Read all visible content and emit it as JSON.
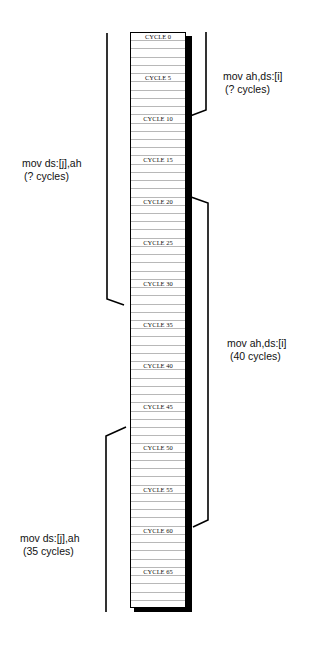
{
  "diagram": {
    "total_cycles": 70,
    "label_every": 5,
    "label_prefix": "CYCLE ",
    "labels": [
      "CYCLE 0",
      "CYCLE 5",
      "CYCLE 10",
      "CYCLE 15",
      "CYCLE 20",
      "CYCLE 25",
      "CYCLE 30",
      "CYCLE 35",
      "CYCLE 40",
      "CYCLE 45",
      "CYCLE 50",
      "CYCLE 55",
      "CYCLE 60",
      "CYCLE 65"
    ]
  },
  "annotations": [
    {
      "side": "right",
      "instruction": "mov ah,ds:[i]",
      "cycles": "(? cycles)",
      "start_cycle": 0,
      "end_cycle": 10
    },
    {
      "side": "left",
      "instruction": "mov ds:[j],ah",
      "cycles": "(? cycles)",
      "start_cycle": 0,
      "end_cycle": 32
    },
    {
      "side": "right",
      "instruction": "mov ah,ds:[i]",
      "cycles": "(40 cycles)",
      "start_cycle": 20,
      "end_cycle": 60
    },
    {
      "side": "left",
      "instruction": "mov ds:[j],ah",
      "cycles": "(35 cycles)",
      "start_cycle": 47,
      "end_cycle": 70
    }
  ]
}
